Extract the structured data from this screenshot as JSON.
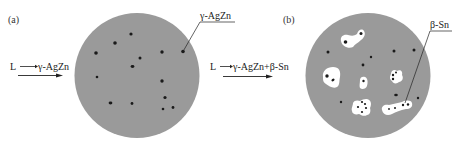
{
  "figure": {
    "panels": [
      {
        "id": "a",
        "panel_label": "(a)",
        "reaction_label": "L——γ-AgZn",
        "reaction_from": "L",
        "reaction_to": "γ-AgZn",
        "phase_callout": "γ-AgZn",
        "description": "Gray liquid matrix with scattered dark γ-AgZn particles"
      },
      {
        "id": "b",
        "panel_label": "(b)",
        "reaction_label": "L——γ-AgZn+β-Sn",
        "reaction_from": "L",
        "reaction_to": "γ-AgZn+β-Sn",
        "phase_callout": "β-Sn",
        "description": "Gray matrix with dark γ-AgZn particles and white β-Sn regions nucleating around them"
      }
    ],
    "colors": {
      "matrix": "#9a9a9a",
      "particle": "#1a1a1a",
      "beta_sn": "#ffffff",
      "line": "#222222"
    }
  }
}
